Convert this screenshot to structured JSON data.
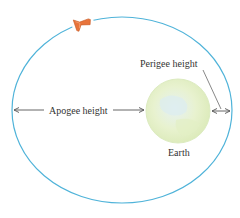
{
  "diagram": {
    "labels": {
      "apogee": "Apogee height",
      "perigee": "Perigee height",
      "earth": "Earth"
    },
    "colors": {
      "orbit": "#4fb3d9",
      "earth_fill": "#e4f0cc",
      "earth_edge": "#d6e8b5",
      "satellite": "#e8743b",
      "arrow": "#555555",
      "text": "#333333"
    },
    "icons": {
      "satellite": "satellite-icon",
      "earth": "earth-icon"
    }
  }
}
